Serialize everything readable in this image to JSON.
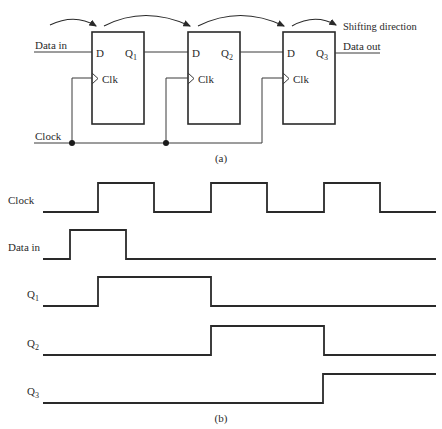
{
  "part_a": {
    "caption": "(a)",
    "shift_label": "Shifting direction",
    "data_in_label": "Data in",
    "data_out_label": "Data out",
    "clock_label": "Clock",
    "flip_flops": [
      {
        "d_label": "D",
        "q_label": "Q",
        "q_sub": "1",
        "clk_label": "Clk"
      },
      {
        "d_label": "D",
        "q_label": "Q",
        "q_sub": "2",
        "clk_label": "Clk"
      },
      {
        "d_label": "D",
        "q_label": "Q",
        "q_sub": "3",
        "clk_label": "Clk"
      }
    ]
  },
  "part_b": {
    "caption": "(b)",
    "signals": [
      {
        "label": "Clock",
        "sub": "",
        "transitions": [
          [
            43,
            0
          ],
          [
            98,
            1
          ],
          [
            154,
            0
          ],
          [
            211,
            1
          ],
          [
            267,
            0
          ],
          [
            324,
            1
          ],
          [
            380,
            0
          ],
          [
            436,
            0
          ]
        ]
      },
      {
        "label": "Data in",
        "sub": "",
        "transitions": [
          [
            43,
            0
          ],
          [
            70,
            1
          ],
          [
            126,
            0
          ],
          [
            436,
            0
          ]
        ]
      },
      {
        "label": "Q",
        "sub": "1",
        "transitions": [
          [
            43,
            0
          ],
          [
            98,
            1
          ],
          [
            211,
            0
          ],
          [
            436,
            0
          ]
        ]
      },
      {
        "label": "Q",
        "sub": "2",
        "transitions": [
          [
            43,
            0
          ],
          [
            211,
            1
          ],
          [
            324,
            0
          ],
          [
            436,
            0
          ]
        ]
      },
      {
        "label": "Q",
        "sub": "3",
        "transitions": [
          [
            43,
            0
          ],
          [
            323,
            1
          ],
          [
            436,
            1
          ]
        ]
      }
    ]
  }
}
